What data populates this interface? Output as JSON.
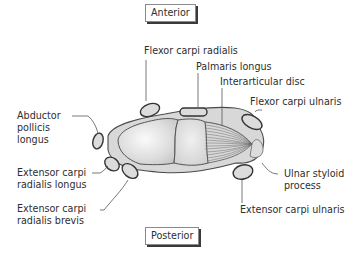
{
  "orientation": {
    "top": "Anterior",
    "bottom": "Posterior"
  },
  "labels": {
    "flexor_carpi_radialis": "Flexor carpi radialis",
    "palmaris_longus": "Palmaris longus",
    "interarticular_disc": "Interarticular disc",
    "flexor_carpi_ulnaris": "Flexor carpi ulnaris",
    "abductor_pollicis_longus": [
      "Abductor",
      "pollicis",
      "longus"
    ],
    "extensor_carpi_radialis_longus": [
      "Extensor carpi",
      "radialis longus"
    ],
    "extensor_carpi_radialis_brevis": [
      "Extensor carpi",
      "radialis brevis"
    ],
    "ulnar_styloid_process": [
      "Ulnar styloid",
      "process"
    ],
    "extensor_carpi_ulnaris": "Extensor carpi ulnaris"
  },
  "colors": {
    "outline": "#3a3a3a",
    "capsule_fill": "#d9d9d9",
    "tendon_fill": "#dcdcdc",
    "leader": "#555555"
  }
}
